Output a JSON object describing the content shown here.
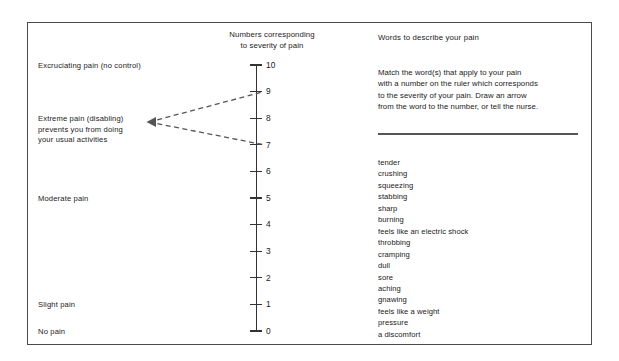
{
  "scale": {
    "header_line1": "Numbers corresponding",
    "header_line2": "to severity of pain",
    "ticks": [
      {
        "value": "10",
        "y": 65
      },
      {
        "value": "9",
        "y": 91.6
      },
      {
        "value": "8",
        "y": 118.2
      },
      {
        "value": "7",
        "y": 144.8
      },
      {
        "value": "6",
        "y": 171.4
      },
      {
        "value": "5",
        "y": 198
      },
      {
        "value": "4",
        "y": 224.6
      },
      {
        "value": "3",
        "y": 251.2
      },
      {
        "value": "2",
        "y": 277.8
      },
      {
        "value": "1",
        "y": 304.4
      },
      {
        "value": "0",
        "y": 331
      }
    ]
  },
  "severity_labels": [
    {
      "text": "Excruciating pain (no control)",
      "y": 61
    },
    {
      "text": "Extreme pain (disabling)\nprevents you from doing\nyour usual activities",
      "y": 114
    },
    {
      "text": "Moderate pain",
      "y": 194
    },
    {
      "text": "Slight pain",
      "y": 300
    },
    {
      "text": "No pain",
      "y": 327
    }
  ],
  "words_panel": {
    "heading": "Words to describe your pain",
    "instructions": "Match the word(s) that apply to your pain\nwith a number on the ruler which corresponds\nto the severity of your pain. Draw an arrow\nfrom the word to the number, or tell the nurse.",
    "words": [
      "tender",
      "crushing",
      "squeezing",
      "stabbing",
      "sharp",
      "burning",
      "feels like an electric shock",
      "throbbing",
      "cramping",
      "dull",
      "sore",
      "aching",
      "gnawing",
      "feels like a weight",
      "pressure",
      "a discomfort"
    ]
  },
  "colors": {
    "border": "#4a4a4a",
    "axis": "#333333",
    "connector": "#555555",
    "text": "#1a1a1a"
  }
}
